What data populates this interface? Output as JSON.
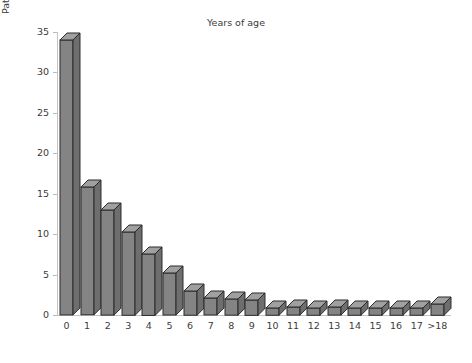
{
  "chart_data": {
    "type": "bar",
    "title": "",
    "subtitle": "",
    "xlabel": "Years of age",
    "ylabel": "Patients (%)",
    "categories": [
      "0",
      "1",
      "2",
      "3",
      "4",
      "5",
      "6",
      "7",
      "8",
      "9",
      "10",
      "11",
      "12",
      "13",
      "14",
      "15",
      "16",
      "17",
      ">18"
    ],
    "values": [
      34.0,
      15.8,
      13.0,
      10.3,
      7.6,
      5.2,
      3.0,
      2.1,
      2.0,
      1.9,
      0.9,
      1.0,
      0.9,
      1.0,
      0.9,
      0.9,
      0.9,
      0.9,
      1.4
    ],
    "ylim": [
      0,
      35
    ],
    "yticks": [
      0,
      5,
      10,
      15,
      20,
      25,
      30,
      35
    ],
    "ytick_labels": [
      "0",
      "5",
      "10",
      "15",
      "20",
      "25",
      "30",
      "35"
    ],
    "grid": false,
    "legend": null,
    "style": "3d-bar",
    "colors": {
      "bar_front": "#848484",
      "bar_top": "#a0a0a0",
      "bar_side": "#6e6e6e",
      "bar_outline": "#2b2b2b",
      "axis": "#c3c3c3",
      "text": "#3b3b3b",
      "background": "#ffffff"
    }
  },
  "figure": {
    "y_axis_title": "Patients (%)",
    "x_axis_title": "Years of age"
  }
}
